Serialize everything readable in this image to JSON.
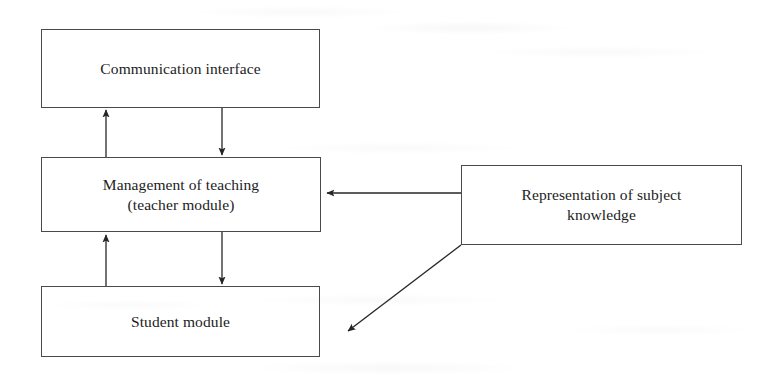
{
  "diagram": {
    "background_color": "#ffffff",
    "line_color": "#262626",
    "box_border_color": "#4a4a4a",
    "text_color": "#1c1c1c",
    "width": 778,
    "height": 385,
    "nodes": [
      {
        "id": "communication-interface",
        "label": "Communication interface",
        "x": 41,
        "y": 29,
        "w": 279,
        "h": 79
      },
      {
        "id": "management-of-teaching",
        "label": "Management of teaching\n(teacher module)",
        "x": 41,
        "y": 157,
        "w": 280,
        "h": 75
      },
      {
        "id": "student-module",
        "label": "Student module",
        "x": 41,
        "y": 286,
        "w": 279,
        "h": 71
      },
      {
        "id": "representation-of-subject-knowledge",
        "label": "Representation of subject\nknowledge",
        "x": 461,
        "y": 165,
        "w": 281,
        "h": 80
      }
    ],
    "edges": [
      {
        "id": "edge-management-to-communication",
        "from": "management-of-teaching",
        "to": "communication-interface",
        "direction": "up",
        "x1": 106,
        "y1": 157,
        "x2": 106,
        "y2": 109
      },
      {
        "id": "edge-communication-to-management",
        "from": "communication-interface",
        "to": "management-of-teaching",
        "direction": "down",
        "x1": 222,
        "y1": 108,
        "x2": 222,
        "y2": 156
      },
      {
        "id": "edge-student-to-management",
        "from": "student-module",
        "to": "management-of-teaching",
        "direction": "up",
        "x1": 106,
        "y1": 286,
        "x2": 106,
        "y2": 234
      },
      {
        "id": "edge-management-to-student",
        "from": "management-of-teaching",
        "to": "student-module",
        "direction": "down",
        "x1": 222,
        "y1": 232,
        "x2": 222,
        "y2": 285
      },
      {
        "id": "edge-knowledge-to-management",
        "from": "representation-of-subject-knowledge",
        "to": "management-of-teaching",
        "direction": "left",
        "x1": 461,
        "y1": 193,
        "x2": 326,
        "y2": 193
      },
      {
        "id": "edge-knowledge-to-student",
        "from": "representation-of-subject-knowledge",
        "to": "student-module",
        "direction": "diagonal-down-left",
        "x1": 461,
        "y1": 245,
        "x2": 346,
        "y2": 333
      }
    ]
  }
}
